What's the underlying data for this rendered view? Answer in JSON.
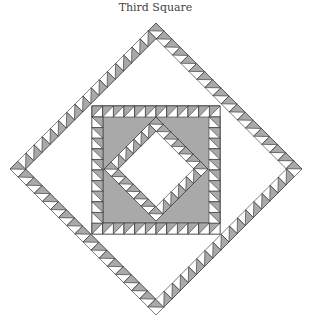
{
  "title": "Third Square",
  "colors": {
    "grey": "#a9a9a9",
    "white": "#ffffff",
    "line": "#333333"
  },
  "quilt": {
    "center": [
      156,
      169
    ],
    "outer_diamond": {
      "half_diagonal": 146,
      "band": 11,
      "cells_per_side": 18
    },
    "middle_square": {
      "x": 92,
      "y": 106,
      "size": 128,
      "band": 11,
      "cells_per_side": 12
    },
    "inner_diamond": {
      "half_diagonal": 52,
      "band": 10,
      "cells_per_side": 7
    }
  }
}
